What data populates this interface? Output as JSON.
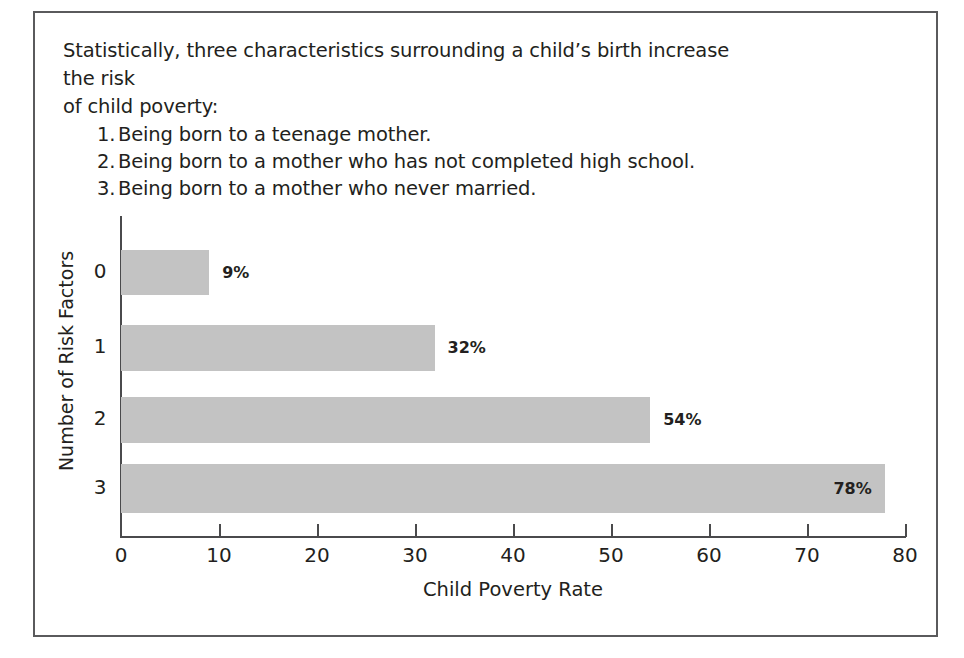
{
  "figure": {
    "intro": {
      "lead_line_1": "Statistically, three characteristics surrounding a child’s birth increase the risk",
      "lead_line_2": "of child poverty:",
      "items": [
        {
          "num": "1.",
          "text": "Being born to a teenage mother."
        },
        {
          "num": "2.",
          "text": "Being born to a mother who has not completed high school."
        },
        {
          "num": "3.",
          "text": "Being born to a mother who never married."
        }
      ]
    },
    "colors": {
      "bar_fill": "#c3c3c3",
      "axis": "#4a4a4c",
      "frame": "#5a5a5c",
      "text": "#231f20",
      "background": "#ffffff"
    }
  },
  "chart_data": {
    "type": "bar",
    "orientation": "horizontal",
    "title": "",
    "xlabel": "Child Poverty Rate",
    "ylabel": "Number of Risk Factors",
    "categories": [
      "0",
      "1",
      "2",
      "3"
    ],
    "values": [
      9,
      32,
      54,
      78
    ],
    "value_labels": [
      "9%",
      "32%",
      "54%",
      "78%"
    ],
    "xlim": [
      0,
      80
    ],
    "xticks": [
      0,
      10,
      20,
      30,
      40,
      50,
      60,
      70,
      80
    ],
    "xtick_labels": [
      "0",
      "10",
      "20",
      "30",
      "40",
      "50",
      "60",
      "70",
      "80"
    ],
    "grid": false,
    "legend": false,
    "label_positions": [
      "outside",
      "outside",
      "outside",
      "inside-right"
    ]
  }
}
